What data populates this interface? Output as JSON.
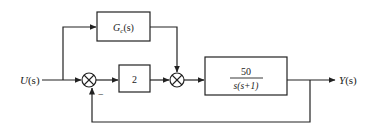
{
  "diagram": {
    "type": "block-diagram",
    "input": {
      "label_main": "U",
      "label_arg": "(s)"
    },
    "output": {
      "label_main": "Y",
      "label_arg": "(s)"
    },
    "feedforward_block": {
      "label_main": "G",
      "label_sub": "c",
      "label_arg": "(s)"
    },
    "gain_block": {
      "label": "2"
    },
    "plant_block": {
      "numerator": "50",
      "denominator": "s(s+1)"
    },
    "summing_junction_1": {
      "sign_feedback": "−"
    },
    "colors": {
      "line": "#222222",
      "background": "#ffffff"
    }
  }
}
